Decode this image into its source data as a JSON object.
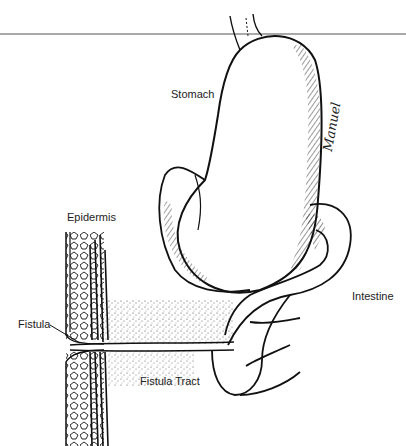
{
  "figure": {
    "type": "anatomical-illustration",
    "labels": {
      "stomach": "Stomach",
      "epidermis": "Epidermis",
      "fistula": "Fistula",
      "fistula_tract": "Fistula Tract",
      "intestine": "Intestine"
    },
    "signature": "Manuel",
    "colors": {
      "ink": "#111111",
      "background": "#ffffff",
      "rule": "#555555"
    }
  }
}
